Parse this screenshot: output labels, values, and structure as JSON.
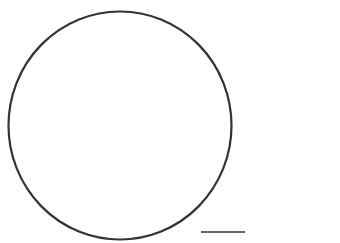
{
  "figure": {
    "background": "#ffffff",
    "stroke_color": "#333333",
    "circle": {
      "cx": 120,
      "cy": 125.5,
      "rx": 111.5,
      "ry": 114,
      "stroke_width": 2.2
    },
    "line": {
      "x1": 201,
      "y1": 232,
      "x2": 245,
      "y2": 232,
      "stroke_width": 1.6
    }
  }
}
